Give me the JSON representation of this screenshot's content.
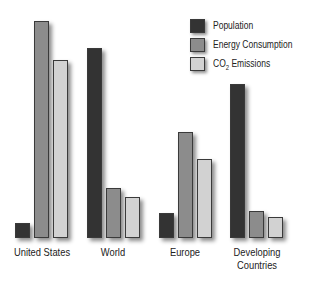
{
  "chart_data": {
    "type": "bar",
    "title": "",
    "xlabel": "",
    "ylabel": "",
    "grid": false,
    "legend_position": "top-right",
    "categories": [
      "United States",
      "World",
      "Europe",
      "Developing Countries"
    ],
    "series": [
      {
        "name": "Population",
        "color": "#333333",
        "values": [
          15,
          190,
          25,
          154
        ]
      },
      {
        "name": "Energy Consumption",
        "color": "#8c8c8c",
        "values": [
          217,
          50,
          106,
          27
        ]
      },
      {
        "name": "CO2 Emissions",
        "color": "#d2d2d2",
        "values": [
          178,
          41,
          79,
          21
        ]
      }
    ],
    "note": "Relative bar heights (no axis shown); values in pixel units estimated from image"
  },
  "legend": {
    "population": "Population",
    "energy": "Energy Consumption",
    "co2_prefix": "CO",
    "co2_sub": "2",
    "co2_suffix": " Emissions"
  },
  "labels": {
    "us": "United States",
    "world": "World",
    "europe": "Europe",
    "dev1": "Developing",
    "dev2": "Countries"
  }
}
